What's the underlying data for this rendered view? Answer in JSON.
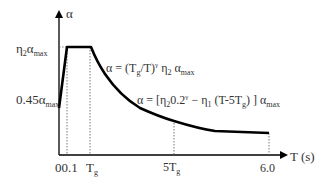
{
  "diagram": {
    "type": "response-spectrum",
    "y_axis_label": "α",
    "x_axis_label": "T (s)",
    "y_ticks": [
      "η2αmax",
      "0.45αmax"
    ],
    "x_ticks": [
      "0",
      "0.1",
      "Tg",
      "5Tg",
      "6.0"
    ],
    "equations": {
      "descending": "α = (Tg/T)^γ η2 αmax",
      "linear": "α = [η2 0.2^γ − η1 (T−5Tg)] αmax"
    },
    "colors": {
      "line": "#000000",
      "text": "#333333",
      "background": "#ffffff"
    }
  },
  "labels": {
    "alpha": "α",
    "t_axis": "T (s)",
    "eta2_a": "η",
    "eta2_sub": "2",
    "alpha_max_a": "α",
    "max": "max",
    "p045": "0.45α",
    "zero01": "00.1",
    "tg_T": "T",
    "g": "g",
    "five_tg": "5T",
    "six": "6.0",
    "eq1_a": "α = (T",
    "eq1_b": "/T)",
    "gamma": "γ",
    "eq1_c": " η",
    "two": "2",
    "eq1_d": " α",
    "eq2_a": "α = [η",
    "eq2_b": "0.2",
    "eq2_c": " − η",
    "one": "1",
    "eq2_d": " (T-5T",
    "eq2_e": ") ] α"
  }
}
